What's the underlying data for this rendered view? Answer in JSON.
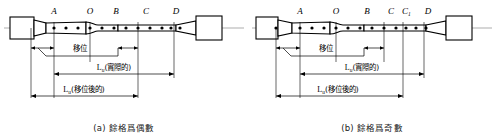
{
  "figure": {
    "background": "#ffffff",
    "line_color": "#000000",
    "panels": [
      {
        "id": "a",
        "caption": "(a) 餘格爲偶數",
        "point_labels": [
          "A",
          "O",
          "B",
          "C",
          "D"
        ],
        "shift_label": "移位",
        "actual_label": "Lu(實際的)",
        "actual_symbol": "L",
        "actual_subscript": "u",
        "actual_suffix": "(實際的)",
        "shifted_label": "Lu(移位後的)",
        "shifted_symbol": "L",
        "shifted_subscript": "u",
        "shifted_suffix": "(移位後的)",
        "mark_count": 15
      },
      {
        "id": "b",
        "caption": "(b) 餘格爲奇數",
        "point_labels": [
          "A",
          "O",
          "B",
          "C",
          "C1",
          "D"
        ],
        "c1_symbol": "C",
        "c1_subscript": "1",
        "shift_label": "移位",
        "actual_label": "Lu(實際的)",
        "actual_symbol": "L",
        "actual_subscript": "u",
        "actual_suffix": "(實際的)",
        "shifted_label": "Lu(移位後的)",
        "shifted_symbol": "L",
        "shifted_subscript": "u",
        "shifted_suffix": "(移位後的)",
        "mark_count": 16
      }
    ]
  }
}
